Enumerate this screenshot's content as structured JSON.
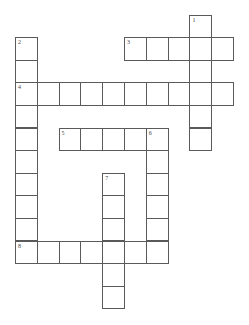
{
  "puzzle": {
    "grid": {
      "origin_x": 15.5,
      "origin_y": 15,
      "cell_w": 21.8,
      "cell_h": 22.6,
      "line_color": "#5a5a5a"
    },
    "entries": [
      {
        "number": "1",
        "direction": "down",
        "row": 0,
        "col": 8,
        "length": 6
      },
      {
        "number": "2",
        "direction": "down",
        "row": 1,
        "col": 0,
        "length": 10
      },
      {
        "number": "3",
        "direction": "across",
        "row": 1,
        "col": 5,
        "length": 5
      },
      {
        "number": "4",
        "direction": "across",
        "row": 3,
        "col": 0,
        "length": 10
      },
      {
        "number": "5",
        "direction": "across",
        "row": 5,
        "col": 2,
        "length": 5
      },
      {
        "number": "6",
        "direction": "down",
        "row": 5,
        "col": 6,
        "length": 6
      },
      {
        "number": "7",
        "direction": "down",
        "row": 7,
        "col": 4,
        "length": 6
      },
      {
        "number": "8",
        "direction": "across",
        "row": 10,
        "col": 0,
        "length": 7
      }
    ]
  }
}
